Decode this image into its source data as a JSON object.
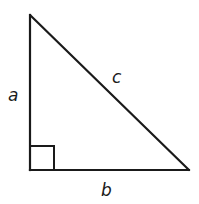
{
  "diagram": {
    "type": "right-triangle",
    "stroke_color": "#1a1a1a",
    "background": "#ffffff",
    "vertices": {
      "top": [
        30,
        15
      ],
      "right_angle": [
        30,
        170
      ],
      "bottom_right": [
        189,
        170
      ]
    },
    "right_angle_marker": {
      "size": 24
    },
    "labels": {
      "a": "a",
      "b": "b",
      "c": "c"
    },
    "sides": [
      {
        "name": "leg-a",
        "label": "a",
        "position": "left vertical leg"
      },
      {
        "name": "leg-b",
        "label": "b",
        "position": "bottom horizontal leg"
      },
      {
        "name": "hypotenuse-c",
        "label": "c",
        "position": "diagonal hypotenuse"
      }
    ]
  }
}
